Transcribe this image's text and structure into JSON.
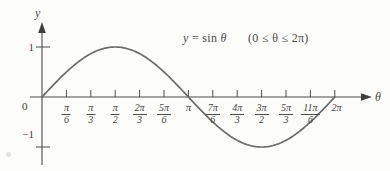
{
  "figure": {
    "background_color": "#fdfdfc",
    "curve_color": "#6b6b6b",
    "axis_color": "#4a4a4a",
    "text_color": "#3f3f3f"
  },
  "axes": {
    "y_axis_label": "y",
    "x_axis_label": "θ",
    "origin_label": "0",
    "y_ticks": [
      {
        "label": "1",
        "value": 1
      },
      {
        "label": "−1",
        "value": -1
      }
    ]
  },
  "equation": {
    "lhs": "y",
    "equals": "=",
    "rhs": "sin",
    "variable": "θ",
    "domain": "(0 ≤ θ ≤ 2π)",
    "full_text": "y = sin θ    (0 ≤ θ ≤ 2π)"
  },
  "chart_data": {
    "type": "line",
    "title": "y = sin θ    (0 ≤ θ ≤ 2π)",
    "xlabel": "θ",
    "ylabel": "y",
    "grid": false,
    "legend": false,
    "xlim": [
      0,
      6.283185307179586
    ],
    "ylim": [
      -1.35,
      1.35
    ],
    "x_tick_labels": [
      {
        "index": 0,
        "label_num": "0",
        "label_den": "",
        "is_fraction": false,
        "value": 0.0
      },
      {
        "index": 1,
        "label_num": "π",
        "label_den": "6",
        "is_fraction": true,
        "value": 0.5235987756
      },
      {
        "index": 2,
        "label_num": "π",
        "label_den": "3",
        "is_fraction": true,
        "value": 1.0471975512
      },
      {
        "index": 3,
        "label_num": "π",
        "label_den": "2",
        "is_fraction": true,
        "value": 1.5707963268
      },
      {
        "index": 4,
        "label_num": "2π",
        "label_den": "3",
        "is_fraction": true,
        "value": 2.0943951024
      },
      {
        "index": 5,
        "label_num": "5π",
        "label_den": "6",
        "is_fraction": true,
        "value": 2.617993878
      },
      {
        "index": 6,
        "label_num": "π",
        "label_den": "",
        "is_fraction": false,
        "value": 3.1415926536
      },
      {
        "index": 7,
        "label_num": "7π",
        "label_den": "6",
        "is_fraction": true,
        "value": 3.6651914292
      },
      {
        "index": 8,
        "label_num": "4π",
        "label_den": "3",
        "is_fraction": true,
        "value": 4.1887902048
      },
      {
        "index": 9,
        "label_num": "3π",
        "label_den": "2",
        "is_fraction": true,
        "value": 4.7123889804
      },
      {
        "index": 10,
        "label_num": "5π",
        "label_den": "3",
        "is_fraction": true,
        "value": 5.235987756
      },
      {
        "index": 11,
        "label_num": "11π",
        "label_den": "6",
        "is_fraction": true,
        "value": 5.7595865316
      },
      {
        "index": 12,
        "label_num": "2π",
        "label_den": "",
        "is_fraction": false,
        "value": 6.2831853072
      }
    ],
    "y_tick_values": [
      1,
      -1
    ],
    "series": [
      {
        "name": "y = sin θ",
        "x": [
          0,
          0.5235987756,
          1.0471975512,
          1.5707963268,
          2.0943951024,
          2.617993878,
          3.1415926536,
          3.6651914292,
          4.1887902048,
          4.7123889804,
          5.235987756,
          5.7595865316,
          6.2831853072
        ],
        "values": [
          0,
          0.5,
          0.866,
          1,
          0.866,
          0.5,
          0,
          -0.5,
          -0.866,
          -1,
          -0.866,
          -0.5,
          0
        ]
      }
    ],
    "annotations": [
      {
        "text": "y = sin θ    (0 ≤ θ ≤ 2π)",
        "x": 2.5,
        "y": 1.15
      }
    ]
  }
}
